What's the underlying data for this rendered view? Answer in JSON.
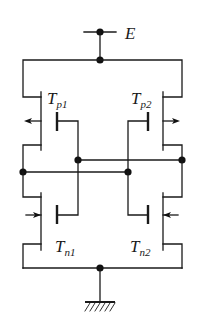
{
  "diagram": {
    "type": "circuit",
    "supply": {
      "label": "E"
    },
    "ground": {
      "label": ""
    },
    "transistors": [
      {
        "id": "Tp1",
        "main": "T",
        "sub": "p1",
        "type": "p-channel"
      },
      {
        "id": "Tp2",
        "main": "T",
        "sub": "p2",
        "type": "p-channel"
      },
      {
        "id": "Tn1",
        "main": "T",
        "sub": "n1",
        "type": "n-channel"
      },
      {
        "id": "Tn2",
        "main": "T",
        "sub": "n2",
        "type": "n-channel"
      }
    ],
    "colors": {
      "line": "#1a1a1a",
      "background": "#ffffff"
    }
  }
}
